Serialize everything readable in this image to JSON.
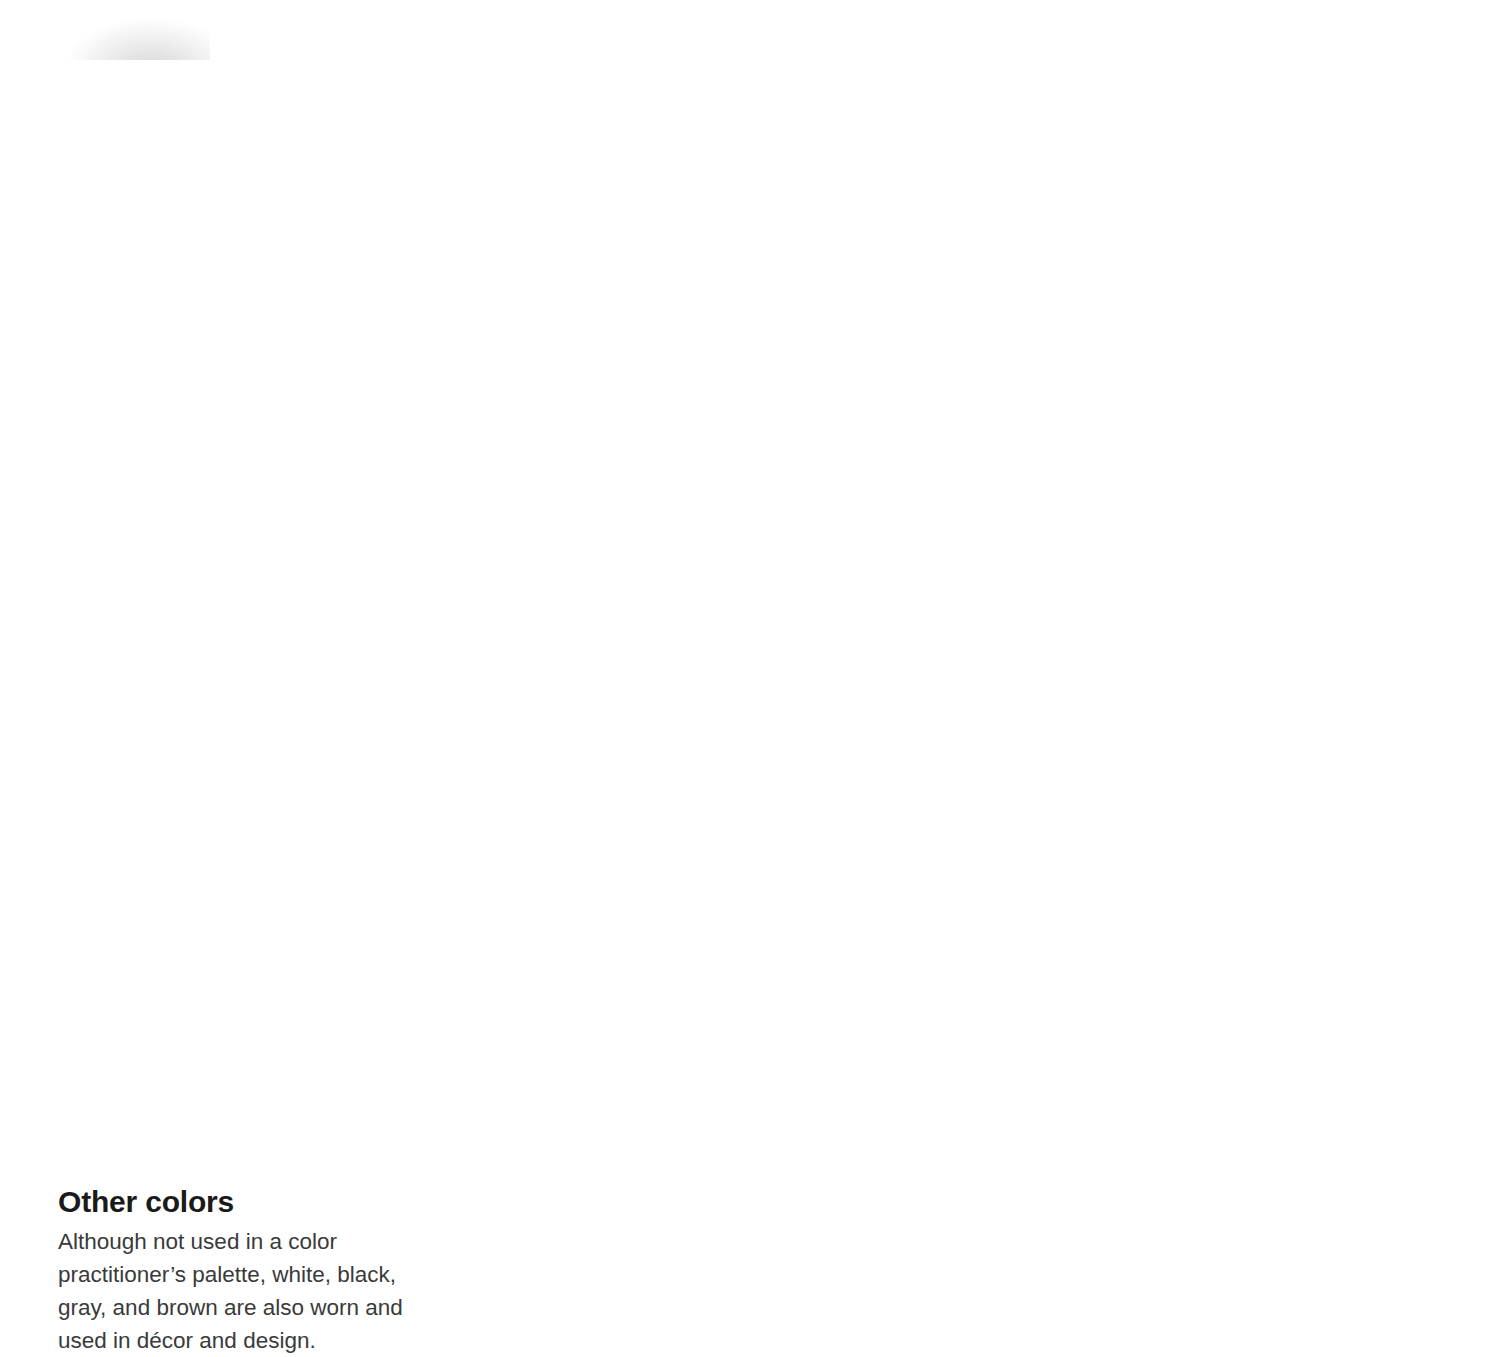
{
  "figure": {
    "kind": "color-fan-deck",
    "pivot": {
      "x": 1480,
      "y": 10
    },
    "blade_count": 13
  },
  "blades": [
    {
      "name": "RED",
      "traits": "DETERMINED, ENERGETIC, STRONG, PIONEERING, FIERY, AGGRESSIVE",
      "angle": -8.5,
      "length": 1230,
      "top": "#ffffff",
      "mid": "#fbfbfb",
      "bot": "#e9e9e9"
    },
    {
      "name": "SCARLET",
      "traits": "PASSIONATE, SEXUAL, WARM, IRRATIONAL, SENSUAL",
      "angle": -2.0,
      "length": 1205,
      "top": "#ffffff",
      "mid": "#f8f8f8",
      "bot": "#e2e2e2"
    },
    {
      "name": "ORANGE",
      "traits": "JOYFUL, IRREPRESSIBLE, CREATIVE, EXTROVERT, SOCIABLE, IRRATIONAL",
      "angle": 5.0,
      "length": 1190,
      "top": "#ffffff",
      "mid": "#f6f6f6",
      "bot": "#dcdcdc"
    },
    {
      "name": "YELLOW",
      "traits": "INTELLECTUAL, MATERIALISTIC, GENEROUS, COURAGEOUS, COWARDLY",
      "angle": 12.0,
      "length": 1175,
      "top": "#ffffff",
      "mid": "#f4f4f4",
      "bot": "#d6d6d6"
    },
    {
      "name": "LIME",
      "traits": "CLEAR-HEADED, PERCEPTIVE, HEALTH-CONSCIOUS, CAREFUL",
      "angle": 19.5,
      "length": 1160,
      "top": "#ffffff",
      "mid": "#f2f2f2",
      "bot": "#d0d0d0"
    },
    {
      "name": "TURQUOISE",
      "traits": "PERCEPTIVE, CLEAR OF MIND, SOPHISTICATED, EGOCENTRIC",
      "angle": 27.0,
      "length": 1150,
      "top": "#ffffff",
      "mid": "#f0f0f0",
      "bot": "#cacaca"
    },
    {
      "name": "GREEN",
      "traits": "BALANCED, STEADFAST, RELIABLE, ENDEARING, STATIC, OBSTINATE, TENACIOUS",
      "angle": 34.5,
      "length": 1145,
      "top": "#ffffff",
      "mid": "#eeeeee",
      "bot": "#c5c5c5"
    },
    {
      "name": "BLUE",
      "traits": "PEACEFUL, CALM, COMMUNICATIVE, MUSICAL, ARTISTIC, INTROSPECTIVE, SINCERE",
      "angle": 42.0,
      "length": 1150,
      "top": "#ffffff",
      "mid": "#ededed",
      "bot": "#c0c0c0"
    },
    {
      "name": "INDIGO",
      "traits": "SCIENTIFIC, METHODICAL, IMAGINATIVE, KNOWLEDGEABLE, OBSESSIONAL",
      "angle": 49.5,
      "length": 1160,
      "top": "#ffffff",
      "mid": "#ececec",
      "bot": "#bcbcbc"
    },
    {
      "name": "VIOLET",
      "traits": "HAVING STRONG CONVICTIONS, INTUITIVE, SPIRITUAL, DOGMATIC, ESOTERIC",
      "angle": 57.0,
      "length": 1175,
      "top": "#ffffff",
      "mid": "#ebebeb",
      "bot": "#b9b9b9"
    },
    {
      "name": "MAGENTA",
      "traits": "VISIONARY, INITIATOR, PRAGMATIC, REALISTIC, OVERPOWERING",
      "angle": 64.5,
      "length": 1195,
      "top": "#ffffff",
      "mid": "#eaeaea",
      "bot": "#b6b6b6"
    },
    {
      "name": "GOLD",
      "traits": "SPIRITUALLY WISE, MATURE, COMPASSIONATE, SELF-GRATIFYING, FINANCIALLY AWARE",
      "angle": 72.0,
      "length": 1215,
      "top": "#ffffff",
      "mid": "#e9e9e9",
      "bot": "#b3b3b3"
    },
    {
      "name": "",
      "traits": "",
      "angle": 79.0,
      "length": 1235,
      "top": "#ffffff",
      "mid": "#f3f3f3",
      "bot": "#cfcfcf"
    }
  ],
  "other_colors": {
    "heading": "Other colors",
    "body": "Although not used in a color practitioner’s palette, white, black, gray, and brown are also worn and used in décor and design."
  },
  "palette": {
    "page_background": "#ffffff",
    "text": "#161616",
    "body_text": "#3a3a3a",
    "heading_text": "#1a1a1a"
  }
}
